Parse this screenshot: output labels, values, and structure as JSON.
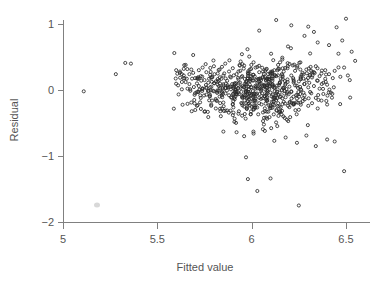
{
  "chart_data": {
    "type": "scatter",
    "title": "",
    "subtitle": "",
    "xlabel": "Fitted value",
    "ylabel": "Residual",
    "xlim": [
      4.92,
      6.62
    ],
    "ylim": [
      -2.12,
      1.22
    ],
    "xticks": [
      5,
      5.5,
      6,
      6.5
    ],
    "xticklabels": [
      "5",
      "5.5",
      "6",
      "6.5"
    ],
    "yticks": [
      1,
      0,
      -1,
      -2
    ],
    "yticklabels": [
      "1",
      "0",
      "-1",
      "-2"
    ],
    "grid": false,
    "legend": null,
    "marker": "open-circle",
    "marker_color": "#2b2b2b",
    "marker_size": 3,
    "n_points": 704,
    "annotations": [],
    "series": [
      {
        "name": "residuals",
        "points": [
          [
            5.11,
            -0.02
          ],
          [
            5.28,
            0.24
          ],
          [
            5.33,
            0.41
          ],
          [
            5.36,
            0.4
          ],
          [
            5.59,
            0.56
          ],
          [
            5.6,
            0.3
          ],
          [
            5.61,
            0.07
          ],
          [
            5.62,
            0.28
          ],
          [
            5.62,
            0.26
          ],
          [
            5.63,
            0.24
          ],
          [
            5.63,
            0.01
          ],
          [
            5.64,
            0.22
          ],
          [
            5.64,
            0.32
          ],
          [
            5.65,
            0.38
          ],
          [
            5.65,
            0.12
          ],
          [
            5.66,
            0.02
          ],
          [
            5.66,
            -0.21
          ],
          [
            5.67,
            0.24
          ],
          [
            5.67,
            0.09
          ],
          [
            5.68,
            -0.19
          ],
          [
            5.68,
            0.31
          ],
          [
            5.69,
            0.26
          ],
          [
            5.69,
            0.53
          ],
          [
            5.7,
            0.18
          ],
          [
            5.7,
            -0.05
          ],
          [
            5.71,
            0.1
          ],
          [
            5.71,
            -0.24
          ],
          [
            5.72,
            0.3
          ],
          [
            5.72,
            0.06
          ],
          [
            5.73,
            -0.12
          ],
          [
            5.73,
            0.21
          ],
          [
            5.74,
            0.34
          ],
          [
            5.74,
            0.02
          ],
          [
            5.75,
            -0.33
          ],
          [
            5.75,
            0.15
          ],
          [
            5.76,
            0.27
          ],
          [
            5.76,
            -0.07
          ],
          [
            5.77,
            0.11
          ],
          [
            5.77,
            -0.41
          ],
          [
            5.78,
            0.23
          ],
          [
            5.78,
            0.04
          ],
          [
            5.79,
            -0.16
          ],
          [
            5.79,
            0.19
          ],
          [
            5.8,
            0.36
          ],
          [
            5.8,
            -0.02
          ],
          [
            5.81,
            0.13
          ],
          [
            5.81,
            -0.28
          ],
          [
            5.82,
            0.25
          ],
          [
            5.82,
            0.08
          ],
          [
            5.83,
            -0.1
          ],
          [
            5.83,
            0.31
          ],
          [
            5.84,
            0.17
          ],
          [
            5.84,
            -0.05
          ],
          [
            5.85,
            0.22
          ],
          [
            5.85,
            -0.19
          ],
          [
            5.86,
            0.4
          ],
          [
            5.86,
            0.03
          ],
          [
            5.87,
            -0.31
          ],
          [
            5.87,
            0.14
          ],
          [
            5.88,
            0.28
          ],
          [
            5.88,
            -0.08
          ],
          [
            5.89,
            0.19
          ],
          [
            5.89,
            0.01
          ],
          [
            5.9,
            -0.22
          ],
          [
            5.9,
            0.33
          ],
          [
            5.91,
            0.1
          ],
          [
            5.91,
            -0.14
          ],
          [
            5.92,
            0.24
          ],
          [
            5.92,
            -0.02
          ],
          [
            5.93,
            0.16
          ],
          [
            5.93,
            -0.36
          ],
          [
            5.94,
            0.29
          ],
          [
            5.94,
            0.05
          ],
          [
            5.95,
            -0.11
          ],
          [
            5.95,
            0.21
          ],
          [
            5.96,
            0.37
          ],
          [
            5.96,
            -0.25
          ],
          [
            5.97,
            0.12
          ],
          [
            5.97,
            -0.03
          ],
          [
            5.98,
            0.26
          ],
          [
            5.98,
            -0.17
          ],
          [
            5.99,
            0.08
          ],
          [
            5.99,
            0.31
          ],
          [
            6.0,
            -0.06
          ],
          [
            6.0,
            0.18
          ],
          [
            6.01,
            -0.29
          ],
          [
            6.01,
            0.23
          ],
          [
            6.02,
            0.02
          ],
          [
            6.02,
            -0.13
          ],
          [
            6.03,
            0.35
          ],
          [
            6.03,
            0.11
          ],
          [
            6.04,
            -0.2
          ],
          [
            6.04,
            0.27
          ],
          [
            6.05,
            -0.01
          ],
          [
            6.05,
            0.15
          ],
          [
            6.06,
            -0.34
          ],
          [
            6.06,
            0.2
          ],
          [
            6.07,
            0.06
          ],
          [
            6.07,
            -0.09
          ],
          [
            6.08,
            0.32
          ],
          [
            6.08,
            0.17
          ],
          [
            6.09,
            -0.23
          ],
          [
            6.09,
            0.09
          ],
          [
            6.1,
            0.25
          ],
          [
            6.1,
            -0.04
          ],
          [
            6.11,
            0.14
          ],
          [
            6.11,
            -0.27
          ],
          [
            6.12,
            0.3
          ],
          [
            6.12,
            0.03
          ],
          [
            6.13,
            -0.15
          ],
          [
            6.13,
            0.21
          ],
          [
            6.14,
            0.38
          ],
          [
            6.14,
            -0.07
          ],
          [
            6.15,
            0.12
          ],
          [
            6.15,
            -0.32
          ],
          [
            6.16,
            0.24
          ],
          [
            6.16,
            0.0
          ],
          [
            6.17,
            -0.18
          ],
          [
            6.17,
            0.28
          ],
          [
            6.18,
            0.1
          ],
          [
            6.18,
            -0.11
          ],
          [
            6.19,
            0.33
          ],
          [
            6.19,
            0.16
          ],
          [
            6.2,
            -0.26
          ],
          [
            6.2,
            0.05
          ],
          [
            6.21,
            0.22
          ],
          [
            6.21,
            -0.02
          ],
          [
            6.22,
            0.18
          ],
          [
            6.22,
            -0.21
          ],
          [
            6.23,
            0.29
          ],
          [
            6.23,
            0.07
          ],
          [
            6.24,
            -0.13
          ],
          [
            6.24,
            0.34
          ],
          [
            6.25,
            0.13
          ],
          [
            6.25,
            -0.3
          ],
          [
            6.26,
            0.2
          ],
          [
            6.26,
            0.01
          ],
          [
            6.27,
            -0.17
          ],
          [
            6.27,
            0.26
          ],
          [
            6.28,
            0.09
          ],
          [
            6.28,
            -0.08
          ],
          [
            6.29,
            0.31
          ],
          [
            6.29,
            0.15
          ],
          [
            6.3,
            -0.24
          ],
          [
            6.3,
            0.04
          ],
          [
            6.31,
            0.23
          ],
          [
            6.31,
            -0.03
          ],
          [
            6.32,
            0.19
          ],
          [
            6.32,
            -0.2
          ],
          [
            6.33,
            0.27
          ],
          [
            6.33,
            0.06
          ],
          [
            6.34,
            -0.12
          ],
          [
            6.34,
            0.36
          ],
          [
            6.35,
            0.14
          ],
          [
            6.35,
            -0.28
          ],
          [
            6.36,
            0.21
          ],
          [
            6.36,
            0.02
          ],
          [
            6.37,
            -0.16
          ],
          [
            6.37,
            0.25
          ],
          [
            6.38,
            0.11
          ],
          [
            6.38,
            -0.06
          ],
          [
            6.39,
            0.3
          ],
          [
            6.39,
            0.17
          ],
          [
            6.4,
            -0.22
          ],
          [
            6.4,
            0.08
          ],
          [
            6.41,
            0.24
          ],
          [
            6.42,
            -0.04
          ],
          [
            6.43,
            0.18
          ],
          [
            6.44,
            0.29
          ],
          [
            6.45,
            0.95
          ],
          [
            6.46,
            0.55
          ],
          [
            6.47,
            0.2
          ],
          [
            6.48,
            0.75
          ],
          [
            6.49,
            0.34
          ],
          [
            6.5,
            1.08
          ],
          [
            6.51,
            0.22
          ],
          [
            6.52,
            0.15
          ],
          [
            6.53,
            0.58
          ],
          [
            5.97,
            -1.02
          ],
          [
            5.98,
            -1.35
          ],
          [
            6.03,
            -1.53
          ],
          [
            6.1,
            -1.34
          ],
          [
            6.25,
            -1.75
          ],
          [
            6.49,
            -1.23
          ],
          [
            5.85,
            -0.63
          ],
          [
            5.92,
            -0.64
          ],
          [
            5.96,
            -0.7
          ],
          [
            6.01,
            -0.66
          ],
          [
            6.07,
            -0.62
          ],
          [
            6.12,
            -0.77
          ],
          [
            6.18,
            -0.72
          ],
          [
            6.24,
            -0.8
          ],
          [
            6.29,
            -0.69
          ],
          [
            6.34,
            -0.85
          ],
          [
            6.4,
            -0.75
          ],
          [
            6.44,
            -0.78
          ],
          [
            6.04,
            0.9
          ],
          [
            6.13,
            1.06
          ],
          [
            6.21,
            0.98
          ],
          [
            6.3,
            0.96
          ],
          [
            6.35,
            0.72
          ],
          [
            6.41,
            0.68
          ],
          [
            6.28,
            0.82
          ],
          [
            6.33,
            0.88
          ]
        ]
      }
    ]
  },
  "axes": {
    "y_title": "Residual",
    "x_title": "Fitted value",
    "axis_color": "#808080",
    "label_color": "#555555",
    "point_color": "#2b2b2b",
    "background": "#ffffff"
  },
  "ticks": {
    "x": [
      {
        "label": "5",
        "value": 5
      },
      {
        "label": "5.5",
        "value": 5.5
      },
      {
        "label": "6",
        "value": 6
      },
      {
        "label": "6.5",
        "value": 6.5
      }
    ],
    "y": [
      {
        "label": "1",
        "value": 1
      },
      {
        "label": "0",
        "value": 0
      },
      {
        "label": "-1",
        "value": -1
      },
      {
        "label": "-2",
        "value": -2
      }
    ]
  }
}
